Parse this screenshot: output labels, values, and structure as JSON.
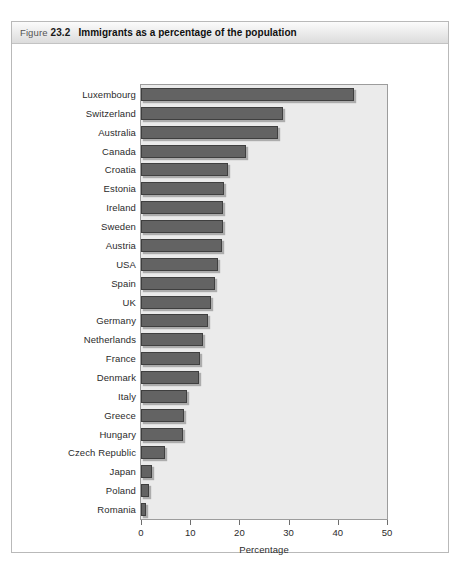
{
  "figure": {
    "label": "Figure",
    "number": "23.2",
    "title": "Immigrants as a percentage of the population"
  },
  "chart_data": {
    "type": "bar",
    "orientation": "horizontal",
    "title": "Immigrants as a percentage of the population",
    "xlabel": "Percentage",
    "ylabel": "",
    "xlim": [
      0,
      50
    ],
    "xticks": [
      0,
      10,
      20,
      30,
      40,
      50
    ],
    "xtick_labels": [
      "0",
      "10",
      "20",
      "30",
      "40",
      "50"
    ],
    "grid": false,
    "legend": null,
    "bar_color": "#636363",
    "bar_edge_color": "#3f3f3f",
    "plot_background": "#ebebeb",
    "categories": [
      "Luxembourg",
      "Switzerland",
      "Australia",
      "Canada",
      "Croatia",
      "Estonia",
      "Ireland",
      "Sweden",
      "Austria",
      "USA",
      "Spain",
      "UK",
      "Germany",
      "Netherlands",
      "France",
      "Denmark",
      "Italy",
      "Greece",
      "Hungary",
      "Czech Republic",
      "Japan",
      "Poland",
      "Romania"
    ],
    "values": [
      43.2,
      28.9,
      27.9,
      21.3,
      17.7,
      16.9,
      16.7,
      16.6,
      16.4,
      15.6,
      15.1,
      14.3,
      13.7,
      12.5,
      12.0,
      11.8,
      9.3,
      8.8,
      8.5,
      4.8,
      2.3,
      1.6,
      1.1
    ]
  }
}
